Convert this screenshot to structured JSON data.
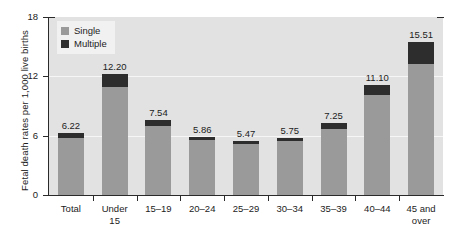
{
  "chart_data": {
    "type": "bar",
    "stacked": true,
    "title": "",
    "xlabel": "",
    "ylabel": "Fetal death rates per 1,000 live births",
    "ylim": [
      0,
      18
    ],
    "yticks": [
      0,
      6,
      12,
      18
    ],
    "ytick_labels": [
      "0",
      "6",
      "12",
      "18"
    ],
    "grid": true,
    "grid_axis": "y",
    "legend_position": "upper-left",
    "categories": [
      "Total",
      "Under\n15",
      "15–19",
      "20–24",
      "25–29",
      "30–34",
      "35–39",
      "40–44",
      "45 and\nover"
    ],
    "totals": [
      6.22,
      12.2,
      7.54,
      5.86,
      5.47,
      5.75,
      7.25,
      11.1,
      15.51
    ],
    "data_labels": [
      "6.22",
      "12.20",
      "7.54",
      "5.86",
      "5.47",
      "5.75",
      "7.25",
      "11.10",
      "15.51"
    ],
    "series": [
      {
        "name": "Single",
        "color": "#9a9a9a",
        "values": [
          5.75,
          10.95,
          6.95,
          5.55,
          5.17,
          5.42,
          6.63,
          10.15,
          13.2
        ]
      },
      {
        "name": "Multiple",
        "color": "#2d2d2d",
        "values": [
          0.47,
          1.25,
          0.59,
          0.31,
          0.3,
          0.33,
          0.62,
          0.95,
          2.31
        ]
      }
    ]
  },
  "legend": {
    "items": [
      {
        "label": "Single",
        "color": "#9a9a9a"
      },
      {
        "label": "Multiple",
        "color": "#2d2d2d"
      }
    ]
  },
  "colors": {
    "plot_background": "#e2e2e2",
    "gridline": "#f6f6f6",
    "axis": "#2a2a2a",
    "text": "#1c1c1c",
    "single": "#9a9a9a",
    "multiple": "#2d2d2d",
    "legend_background": "#f1f1f1"
  }
}
